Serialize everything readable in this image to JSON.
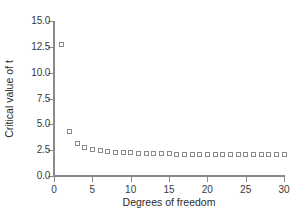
{
  "chart_data": {
    "type": "scatter",
    "title": "",
    "xlabel": "Degrees of freedom",
    "ylabel": "Critical value of t",
    "xlim": [
      0,
      30
    ],
    "ylim": [
      0.0,
      15.0
    ],
    "grid": false,
    "legend": null,
    "marker": "open-square",
    "marker_color": "#8a8a8a",
    "xticks": [
      0,
      5,
      10,
      15,
      20,
      25,
      30
    ],
    "xtick_labels": [
      "0",
      "5",
      "10",
      "15",
      "20",
      "25",
      "30"
    ],
    "yticks": [
      0.0,
      2.5,
      5.0,
      7.5,
      10.0,
      12.5,
      15.0
    ],
    "ytick_labels": [
      "0.0",
      "2.5",
      "5.0",
      "7.5",
      "10.0",
      "12.5",
      "15.0"
    ],
    "x": [
      1,
      2,
      3,
      4,
      5,
      6,
      7,
      8,
      9,
      10,
      11,
      12,
      13,
      14,
      15,
      16,
      17,
      18,
      19,
      20,
      21,
      22,
      23,
      24,
      25,
      26,
      27,
      28,
      29,
      30
    ],
    "y": [
      12.71,
      4.3,
      3.18,
      2.78,
      2.57,
      2.45,
      2.36,
      2.31,
      2.26,
      2.23,
      2.2,
      2.18,
      2.16,
      2.14,
      2.13,
      2.12,
      2.11,
      2.1,
      2.09,
      2.09,
      2.08,
      2.07,
      2.07,
      2.06,
      2.06,
      2.06,
      2.05,
      2.05,
      2.05,
      2.04
    ]
  }
}
